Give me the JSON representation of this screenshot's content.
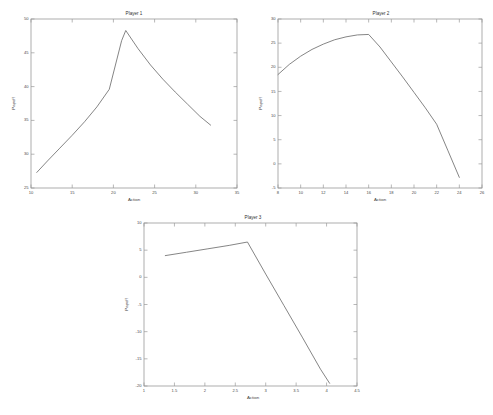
{
  "figure": {
    "background": "#ffffff",
    "line_color": "#6f6f6f",
    "axis_color": "#9a9a9a",
    "text_color": "#3d3d3d"
  },
  "chart_data": [
    {
      "type": "line",
      "title": "Player 1",
      "xlabel": "Action",
      "ylabel": "Payoff",
      "xlim": [
        10,
        35
      ],
      "ylim": [
        25,
        50
      ],
      "xticks": [
        10,
        15,
        20,
        25,
        30,
        35
      ],
      "yticks": [
        25,
        30,
        35,
        40,
        45,
        50
      ],
      "xticklabels": [
        "10",
        "15",
        "20",
        "25",
        "30",
        "35"
      ],
      "yticklabels": [
        "25",
        "30",
        "35",
        "40",
        "45",
        "50"
      ],
      "grid": false,
      "legend": null,
      "x": [
        10.7,
        12.0,
        13.5,
        15.0,
        16.5,
        18.0,
        19.5,
        21.0,
        21.5,
        23.0,
        24.5,
        26.0,
        27.5,
        29.0,
        30.5,
        31.8
      ],
      "y": [
        27.3,
        29.0,
        30.9,
        32.8,
        34.8,
        37.0,
        39.6,
        46.8,
        48.3,
        45.6,
        43.2,
        41.1,
        39.2,
        37.4,
        35.6,
        34.3
      ]
    },
    {
      "type": "line",
      "title": "Player 2",
      "xlabel": "Action",
      "ylabel": "Payoff",
      "xlim": [
        8,
        26
      ],
      "ylim": [
        -5,
        30
      ],
      "xticks": [
        8,
        10,
        12,
        14,
        16,
        18,
        20,
        22,
        24,
        26
      ],
      "yticks": [
        -5,
        0,
        5,
        10,
        15,
        20,
        25,
        30
      ],
      "xticklabels": [
        "8",
        "10",
        "12",
        "14",
        "16",
        "18",
        "20",
        "22",
        "24",
        "26"
      ],
      "yticklabels": [
        "-5",
        "0",
        "5",
        "10",
        "15",
        "20",
        "25",
        "30"
      ],
      "grid": false,
      "legend": null,
      "x": [
        8.0,
        9.0,
        10.0,
        11.0,
        12.0,
        13.0,
        14.0,
        15.0,
        16.0,
        17.0,
        18.0,
        19.0,
        20.0,
        21.0,
        22.0,
        23.0,
        24.0
      ],
      "y": [
        18.5,
        20.6,
        22.3,
        23.7,
        24.8,
        25.7,
        26.3,
        26.7,
        26.8,
        24.2,
        21.1,
        18.0,
        14.8,
        11.6,
        8.2,
        2.7,
        -2.8
      ]
    },
    {
      "type": "line",
      "title": "Player 3",
      "xlabel": "Action",
      "ylabel": "Payoff",
      "xlim": [
        1,
        4.5
      ],
      "ylim": [
        -20,
        10
      ],
      "xticks": [
        1,
        1.5,
        2,
        2.5,
        3,
        3.5,
        4,
        4.5
      ],
      "yticks": [
        -20,
        -15,
        -10,
        -5,
        0,
        5,
        10
      ],
      "xticklabels": [
        "1",
        "1.5",
        "2",
        "2.5",
        "3",
        "3.5",
        "4",
        "4.5"
      ],
      "yticklabels": [
        "-20",
        "-15",
        "-10",
        "-5",
        "0",
        "5",
        "10"
      ],
      "grid": false,
      "legend": null,
      "x": [
        1.35,
        1.7,
        2.05,
        2.4,
        2.7,
        3.0,
        3.3,
        3.6,
        3.9,
        4.05
      ],
      "y": [
        4.0,
        4.62,
        5.25,
        5.88,
        6.5,
        0.6,
        -5.2,
        -11.0,
        -16.9,
        -19.5
      ]
    }
  ]
}
